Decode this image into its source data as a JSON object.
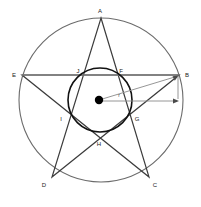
{
  "figure": {
    "colors": {
      "outer_circle_stroke": "#6b6b6b",
      "inner_circle_stroke": "#111111",
      "star_stroke": "#3c3c3c",
      "chord_stroke": "#7a7a7a",
      "dimension_stroke": "#8a8a8a",
      "center_dot_fill": "#000000",
      "label_text": "#1a1a1a",
      "background": "#ffffff"
    },
    "geometry": {
      "outer_circle": {
        "cx": 101,
        "cy": 100,
        "r": 82
      },
      "inner_circle": {
        "cx": 100,
        "cy": 100,
        "r": 32
      },
      "center_dot": {
        "cx": 99,
        "cy": 100,
        "r": 4
      }
    },
    "points": [
      {
        "id": "A",
        "label": "A",
        "x": 101,
        "y": 18,
        "label_x": 100,
        "label_y": 13
      },
      {
        "id": "B",
        "label": "B",
        "x": 179,
        "y": 75,
        "label_x": 187,
        "label_y": 76
      },
      {
        "id": "C",
        "label": "C",
        "x": 149,
        "y": 177,
        "label_x": 155,
        "label_y": 186
      },
      {
        "id": "D",
        "label": "D",
        "x": 52,
        "y": 177,
        "label_x": 44,
        "label_y": 186
      },
      {
        "id": "E",
        "label": "E",
        "x": 22,
        "y": 75,
        "label_x": 14,
        "label_y": 76
      },
      {
        "id": "F",
        "label": "F",
        "x": 124,
        "y": 75,
        "label_x": 121,
        "label_y": 73
      },
      {
        "id": "G",
        "label": "G",
        "x": 132,
        "y": 117,
        "label_x": 136,
        "label_y": 120
      },
      {
        "id": "H",
        "label": "H",
        "x": 100,
        "y": 139,
        "label_x": 99,
        "label_y": 145
      },
      {
        "id": "I",
        "label": "I",
        "x": 67,
        "y": 117,
        "label_x": 61,
        "label_y": 120
      },
      {
        "id": "J",
        "label": "J",
        "x": 77,
        "y": 75,
        "label_x": 78,
        "label_y": 73
      }
    ],
    "star_path": "A,C,E,B,D,A",
    "chords": [
      {
        "name": "chord-E-B",
        "from": "E",
        "to": "B"
      }
    ],
    "dimensions": [
      {
        "name": "radius-to-B",
        "label": "r",
        "from": "center",
        "to": "B",
        "label_x": 119,
        "label_y": 97
      },
      {
        "name": "horizontal-extent",
        "from": "center",
        "to": "right",
        "arrow": "right"
      },
      {
        "name": "vertical-drop-from-B",
        "from": "B",
        "to": "down",
        "arrow": "down"
      }
    ]
  }
}
